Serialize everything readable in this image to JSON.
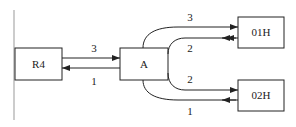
{
  "diagram": {
    "nodes": [
      {
        "id": "R4",
        "label": "R4"
      },
      {
        "id": "A",
        "label": "A"
      },
      {
        "id": "01H",
        "label": "01H"
      },
      {
        "id": "02H",
        "label": "02H"
      }
    ],
    "edges": [
      {
        "from": "R4",
        "to": "A",
        "label": "3"
      },
      {
        "from": "A",
        "to": "R4",
        "label": "1"
      },
      {
        "from": "A",
        "to": "01H",
        "label": "3"
      },
      {
        "from": "01H",
        "to": "A",
        "label": "2"
      },
      {
        "from": "A",
        "to": "02H",
        "label": "2"
      },
      {
        "from": "02H",
        "to": "A",
        "label": "1"
      }
    ],
    "colors": {
      "stroke": "#222222",
      "background": "#ffffff"
    }
  }
}
